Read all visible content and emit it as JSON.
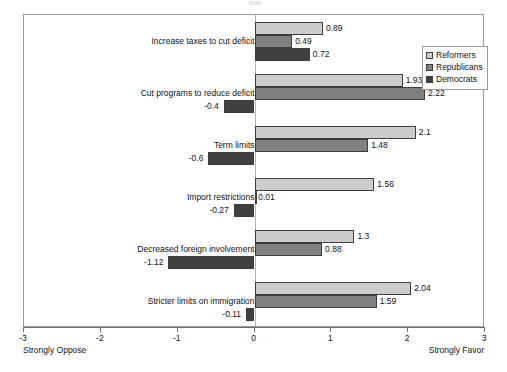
{
  "chart_data": {
    "type": "bar",
    "orientation": "horizontal",
    "title": "",
    "xlabel": "",
    "ylabel": "",
    "xlim": [
      -3,
      3
    ],
    "xticks": [
      -3,
      -2,
      -1,
      0,
      1,
      2,
      3
    ],
    "xtick_labels": [
      "-3",
      "-2",
      "-1",
      "0",
      "1",
      "2",
      "3"
    ],
    "grid": false,
    "zero_line": true,
    "axis_caption_left": "Strongly Oppose",
    "axis_caption_right": "Strongly Favor",
    "legend_position": "top-right",
    "categories": [
      "Increase taxes to cut deficit",
      "Cut programs to reduce deficit",
      "Term limits",
      "Import restrictions",
      "Decreased foreign involvement",
      "Stricter limits on immigration"
    ],
    "series": [
      {
        "name": "Reformers",
        "color": "#cccccc",
        "values": [
          0.89,
          1.93,
          2.1,
          1.56,
          1.3,
          2.04
        ],
        "labels": [
          "0.89",
          "1.93",
          "2.1",
          "1.56",
          "1.3",
          "2.04"
        ]
      },
      {
        "name": "Republicans",
        "color": "#808080",
        "values": [
          0.49,
          2.22,
          1.48,
          0.01,
          0.88,
          1.59
        ],
        "labels": [
          "0.49",
          "2.22",
          "1.48",
          "0.01",
          "0.88",
          "1.59"
        ]
      },
      {
        "name": "Democrats",
        "color": "#404040",
        "values": [
          0.72,
          -0.4,
          -0.6,
          -0.27,
          -1.12,
          -0.11
        ],
        "labels": [
          "0.72",
          "-0.4",
          "-0.6",
          "-0.27",
          "-1.12",
          "-0.11"
        ]
      }
    ]
  }
}
